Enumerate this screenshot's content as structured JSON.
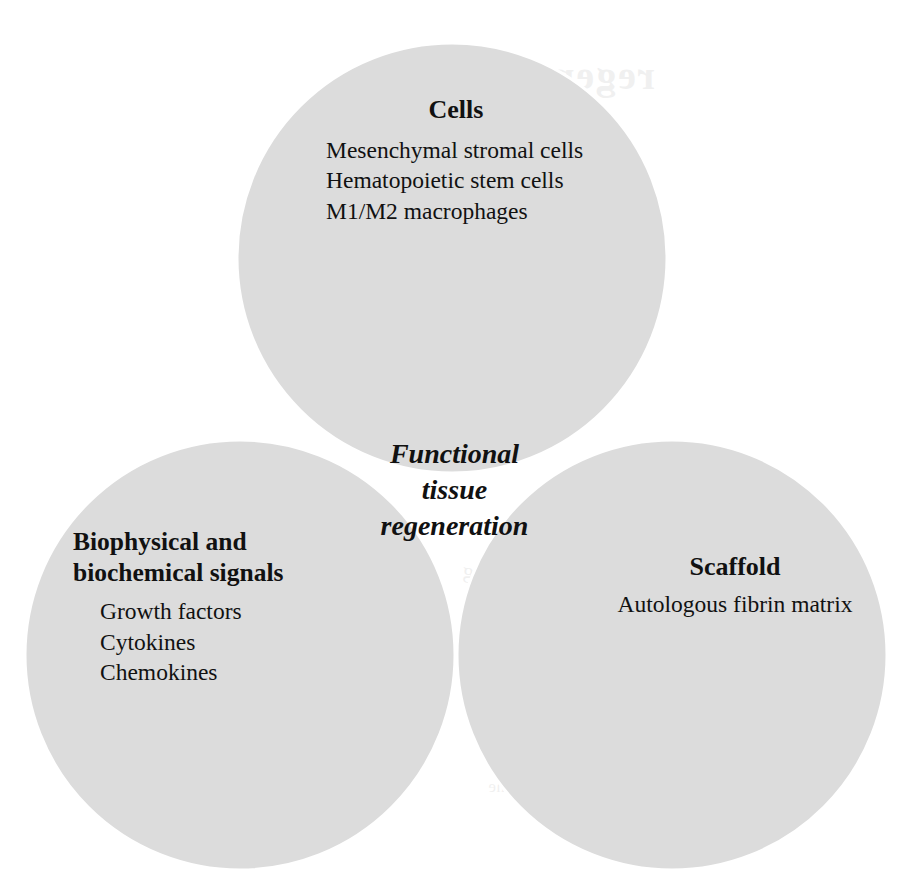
{
  "figure": {
    "type": "venn-diagram-3-set",
    "background_color": "#ffffff",
    "set_fill_color": "#dcdcdc",
    "pair_overlap_color": "#e8e8e8",
    "triple_overlap_color": "#f7f7f7",
    "outline_color": "#ffffff",
    "text_color": "#111111"
  },
  "sets": {
    "cells": {
      "title": "Cells",
      "items": [
        "Mesenchymal stromal cells",
        "Hematopoietic stem cells",
        "M1/M2 macrophages"
      ]
    },
    "signals": {
      "title_line1": "Biophysical and",
      "title_line2": "biochemical signals",
      "items": [
        "Growth factors",
        "Cytokines",
        "Chemokines"
      ]
    },
    "scaffold": {
      "title": "Scaffold",
      "items": [
        "Autologous fibrin matrix"
      ]
    }
  },
  "center": {
    "line1": "Functional",
    "line2": "tissue",
    "line3": "regeneration"
  },
  "bleedthrough": {
    "line1": "regeneration",
    "line2": "once chronic",
    "line3": "tissue studies",
    "line4": "wound healing",
    "line5": "the clinical trials",
    "line6": "of regenerative medicine"
  }
}
